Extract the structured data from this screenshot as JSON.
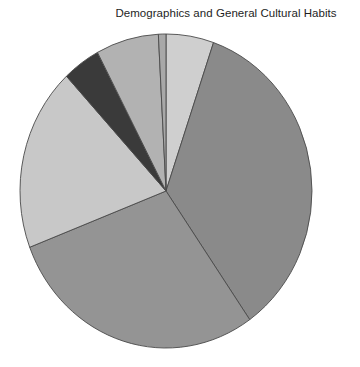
{
  "chart_data": {
    "type": "pie",
    "title": "Demographics and General Cultural Habits",
    "xlabel": "",
    "ylabel": "",
    "legend": "none",
    "grid": false,
    "start_angle_deg": 0,
    "direction": "clockwise",
    "center": {
      "cx": 166,
      "cy": 191,
      "rx": 146,
      "ry": 157
    },
    "categories": [
      "Slice 1",
      "Slice 2",
      "Slice 3",
      "Slice 4",
      "Slice 5",
      "Slice 6",
      "Slice 7"
    ],
    "values": [
      5.3,
      35.0,
      28.9,
      18.9,
      4.2,
      6.9,
      0.8
    ],
    "angles_deg": [
      19,
      126,
      104,
      68,
      15,
      25,
      3
    ],
    "colors": [
      "#cfcfcf",
      "#8a8a8a",
      "#949494",
      "#c8c8c8",
      "#3a3a3a",
      "#b2b2b2",
      "#a8a8a8"
    ],
    "slice_border_color": "#4a4a4a",
    "background_color": "#ffffff",
    "slices": [
      {
        "label": "Slice 1",
        "value": 5.3,
        "angle_deg": 19,
        "color": "#cfcfcf"
      },
      {
        "label": "Slice 2",
        "value": 35.0,
        "angle_deg": 126,
        "color": "#8a8a8a"
      },
      {
        "label": "Slice 3",
        "value": 28.9,
        "angle_deg": 104,
        "color": "#949494"
      },
      {
        "label": "Slice 4",
        "value": 18.9,
        "angle_deg": 68,
        "color": "#c8c8c8"
      },
      {
        "label": "Slice 5",
        "value": 4.2,
        "angle_deg": 15,
        "color": "#3a3a3a"
      },
      {
        "label": "Slice 6",
        "value": 6.9,
        "angle_deg": 25,
        "color": "#b2b2b2"
      },
      {
        "label": "Slice 7",
        "value": 0.8,
        "angle_deg": 3,
        "color": "#a8a8a8"
      }
    ]
  }
}
